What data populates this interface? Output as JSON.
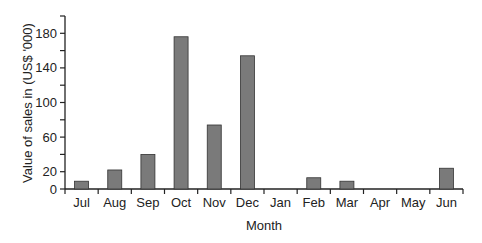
{
  "chart_data": {
    "type": "bar",
    "title": "",
    "xlabel": "Month",
    "ylabel": "Value of sales in (US$ '000)",
    "categories": [
      "Jul",
      "Aug",
      "Sep",
      "Oct",
      "Nov",
      "Dec",
      "Jan",
      "Feb",
      "Mar",
      "Apr",
      "May",
      "Jun"
    ],
    "values": [
      9,
      22,
      40,
      176,
      74,
      154,
      0,
      13,
      9,
      0,
      0,
      24
    ],
    "ylim": [
      0,
      200
    ],
    "yticks_labeled": [
      0,
      20,
      60,
      100,
      140,
      180
    ],
    "yticks_minor": [
      40,
      80,
      120,
      160,
      200
    ],
    "grid": false,
    "legend": null,
    "bar_color": "#7a7a7a",
    "bar_edge_color": "#333333"
  }
}
